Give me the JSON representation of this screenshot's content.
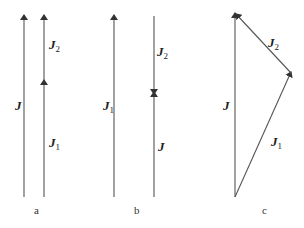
{
  "panels": [
    {
      "caption": "a",
      "description": "J = J1 + J2 collinear, same direction",
      "labels": {
        "J": "J",
        "J2": "J",
        "J2_sub": "2",
        "J1": "J",
        "J1_sub": "1"
      }
    },
    {
      "caption": "b",
      "description": "J1 = J + J2 with J and J2 opposite, meeting head to head",
      "labels": {
        "J1": "J",
        "J1_sub": "1",
        "J2": "J",
        "J2_sub": "2",
        "J": "J"
      }
    },
    {
      "caption": "c",
      "description": "Vector triangle J = J1 + J2",
      "labels": {
        "J": "J",
        "J2": "J",
        "J2_sub": "2",
        "J1": "J",
        "J1_sub": "1"
      }
    }
  ],
  "colors": {
    "line": "#555555",
    "text": "#222222"
  }
}
